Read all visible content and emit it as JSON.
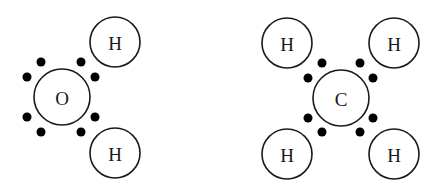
{
  "diagram": {
    "type": "electron-dot-structures",
    "molecules": [
      {
        "name": "water",
        "central_atom": {
          "label": "O",
          "cx": 62,
          "cy": 97,
          "r": 28
        },
        "bonded_atoms": [
          {
            "label": "H",
            "cx": 115,
            "cy": 42,
            "r": 25
          },
          {
            "label": "H",
            "cx": 115,
            "cy": 153,
            "r": 25
          }
        ],
        "electrons": [
          {
            "cx": 41,
            "cy": 62
          },
          {
            "cx": 81,
            "cy": 62
          },
          {
            "cx": 27,
            "cy": 77
          },
          {
            "cx": 95,
            "cy": 77
          },
          {
            "cx": 27,
            "cy": 117
          },
          {
            "cx": 95,
            "cy": 117
          },
          {
            "cx": 41,
            "cy": 132
          },
          {
            "cx": 81,
            "cy": 132
          }
        ]
      },
      {
        "name": "methane",
        "central_atom": {
          "label": "C",
          "cx": 341,
          "cy": 98,
          "r": 28
        },
        "bonded_atoms": [
          {
            "label": "H",
            "cx": 287,
            "cy": 43,
            "r": 25
          },
          {
            "label": "H",
            "cx": 394,
            "cy": 43,
            "r": 25
          },
          {
            "label": "H",
            "cx": 287,
            "cy": 154,
            "r": 25
          },
          {
            "label": "H",
            "cx": 394,
            "cy": 154,
            "r": 25
          }
        ],
        "electrons": [
          {
            "cx": 322,
            "cy": 63
          },
          {
            "cx": 360,
            "cy": 63
          },
          {
            "cx": 308,
            "cy": 78
          },
          {
            "cx": 373,
            "cy": 78
          },
          {
            "cx": 308,
            "cy": 118
          },
          {
            "cx": 373,
            "cy": 118
          },
          {
            "cx": 322,
            "cy": 132
          },
          {
            "cx": 360,
            "cy": 132
          }
        ]
      }
    ],
    "electron_radius": 4.5
  }
}
